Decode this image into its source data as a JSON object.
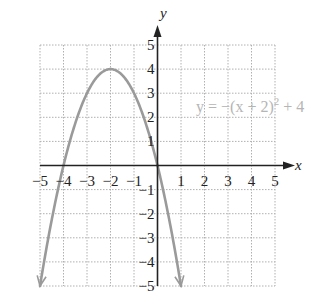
{
  "chart_data": {
    "type": "line",
    "title": "",
    "xlabel": "x",
    "ylabel": "y",
    "xlim": [
      -5,
      5
    ],
    "ylim": [
      -5,
      5
    ],
    "grid": true,
    "grid_style": "dotted",
    "x_ticks": [
      "−5",
      "−4",
      "−3",
      "−2",
      "−1",
      "1",
      "2",
      "3",
      "4",
      "5"
    ],
    "y_ticks": [
      "5",
      "4",
      "3",
      "2",
      "1",
      "−1",
      "−2",
      "−3",
      "−4",
      "−5"
    ],
    "series": [
      {
        "name": "y = −(x + 2)² + 4",
        "equation": "y = -(x + 2)^2 + 4",
        "vertex": [
          -2,
          4
        ],
        "x_intercepts": [
          -4,
          0
        ],
        "y_intercept": 0,
        "x": [
          -4.24,
          -4,
          -3.5,
          -3,
          -2.5,
          -2,
          -1.5,
          -1,
          -0.5,
          0,
          0.24
        ],
        "values": [
          -1,
          0,
          1.75,
          3,
          3.75,
          4,
          3.75,
          3,
          1.75,
          0,
          -1
        ],
        "color": "#9a9a9a",
        "arrows_both_ends": true
      }
    ],
    "annotations": [
      {
        "text": "y = −(x + 2)² + 4",
        "position": [
          2.3,
          2.5
        ]
      }
    ]
  },
  "labels": {
    "x_axis": "x",
    "y_axis": "y",
    "equation_lhs": "y = −(x + 2)",
    "equation_exp": "2",
    "equation_rhs": " + 4"
  },
  "colors": {
    "axis": "#222222",
    "grid": "#b0b0b0",
    "curve": "#9a9a9a",
    "equation": "#b5b5b5"
  }
}
